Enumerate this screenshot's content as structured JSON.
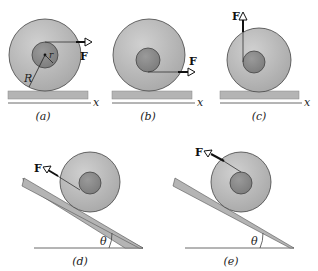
{
  "figure": {
    "force_label": "F",
    "axis_label": "x",
    "outer_radius_label": "R",
    "inner_radius_label": "r",
    "angle_label": "θ",
    "colors": {
      "outer_disk": "#b9b9b9",
      "inner_hub": "#8c8c8c",
      "surface": "#b4b4b4",
      "line": "#333333"
    },
    "panels": [
      {
        "id": "a",
        "caption": "(a)",
        "description": "Force F applied horizontally at top of inner hub, level surface"
      },
      {
        "id": "b",
        "caption": "(b)",
        "description": "Force F applied horizontally at bottom of inner hub, level surface"
      },
      {
        "id": "c",
        "caption": "(c)",
        "description": "Force F applied vertically upward at left of inner hub, level surface"
      },
      {
        "id": "d",
        "caption": "(d)",
        "description": "Force F applied up-slope at bottom of hub, incline at angle θ"
      },
      {
        "id": "e",
        "caption": "(e)",
        "description": "Force F applied up-slope at top of hub, incline at angle θ"
      }
    ]
  }
}
